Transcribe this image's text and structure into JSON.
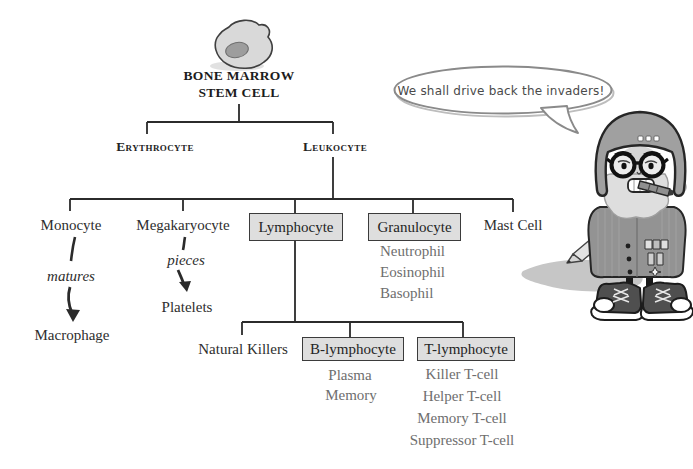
{
  "colors": {
    "background": "#ffffff",
    "line": "#2b2b2b",
    "box_fill": "#dedede",
    "box_border": "#3b3b3b",
    "text": "#2e2e2e",
    "muted_text": "#6e6e6e",
    "bubble_border": "#8a8a8a"
  },
  "tree": {
    "root": {
      "line1": "BONE MARROW",
      "line2": "STEM CELL"
    },
    "branches": [
      {
        "label": "Erythrocyte"
      },
      {
        "label": "Leukocyte"
      }
    ],
    "leukocyte_children": [
      {
        "label": "Monocyte"
      },
      {
        "label": "Megakaryocyte"
      },
      {
        "label": "Lymphocyte"
      },
      {
        "label": "Granulocyte"
      },
      {
        "label": "Mast Cell"
      }
    ],
    "monocyte_path": {
      "verb": "matures",
      "result": "Macrophage"
    },
    "megakaryocyte_path": {
      "verb": "pieces",
      "result": "Platelets"
    },
    "granulocyte_types": [
      "Neutrophil",
      "Eosinophil",
      "Basophil"
    ],
    "lymphocyte_children": [
      {
        "label": "Natural Killers"
      },
      {
        "label": "B-lymphocyte"
      },
      {
        "label": "T-lymphocyte"
      }
    ],
    "b_cell_types": [
      "Plasma",
      "Memory"
    ],
    "t_cell_types": [
      "Killer T-cell",
      "Helper T-cell",
      "Memory T-cell",
      "Suppressor T-cell"
    ]
  },
  "speech_bubble": {
    "text": "We shall drive back the invaders!"
  },
  "illustrations": {
    "stem_cell": "bone-marrow-stem-cell-blob",
    "mascot": "bespectacled-soldier-leukocyte-mascot"
  }
}
